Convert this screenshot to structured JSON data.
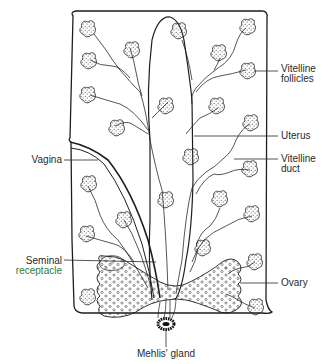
{
  "diagram": {
    "colors": {
      "ink": "#1e1e1e",
      "label_text": "#2a2a2a",
      "receptacle_label": "#2f7a3a",
      "background": "#ffffff"
    },
    "labels": {
      "vitelline_follicles": "Vitelline\nfollicles",
      "uterus": "Uterus",
      "vitelline_duct": "Vitelline\nduct",
      "vagina": "Vagina",
      "seminal_receptacle_line1": "Seminal",
      "seminal_receptacle_line2": "receptacle",
      "ovary": "Ovary",
      "mehlis_gland": "Mehlis' gland"
    },
    "structures": [
      "body outline",
      "uterus",
      "vagina",
      "vitelline follicles",
      "vitelline ducts",
      "seminal receptacle",
      "ovary",
      "Mehlis' gland"
    ]
  }
}
